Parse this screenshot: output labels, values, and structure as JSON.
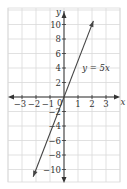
{
  "chart_data": {
    "type": "line",
    "title": "",
    "xlabel": "x",
    "ylabel": "y",
    "xlim": [
      -4,
      4
    ],
    "ylim": [
      -12,
      12
    ],
    "grid": true,
    "x_ticks": [
      -3,
      -2,
      -1,
      1,
      2,
      3
    ],
    "x_tick_labels": [
      "−3",
      "−2",
      "−1",
      "1",
      "2",
      "3"
    ],
    "y_ticks": [
      10,
      8,
      6,
      4,
      2,
      -2,
      -4,
      -6,
      -8,
      -10
    ],
    "y_tick_labels": [
      "10",
      "8",
      "6",
      "4",
      "2",
      "−2",
      "−4",
      "−6",
      "−8",
      "−10"
    ],
    "origin_label": "0",
    "series": [
      {
        "name": "y = 5x",
        "equation": "y = 5x",
        "x": [
          -2.2,
          -2,
          -1,
          0,
          1,
          2,
          2.1
        ],
        "y": [
          -11,
          -10,
          -5,
          0,
          5,
          10,
          10.5
        ]
      }
    ],
    "annotations": [
      {
        "text": "y = 5x",
        "x": 1.3,
        "y": 4
      }
    ],
    "colors": {
      "grid": "#d9d9d9",
      "axis": "#333333",
      "line": "#444444"
    }
  }
}
